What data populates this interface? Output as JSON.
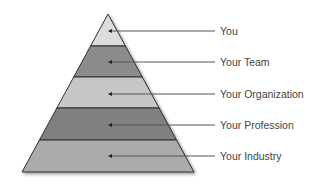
{
  "diagram": {
    "type": "pyramid",
    "apex": [
      108,
      14
    ],
    "base_left": [
      22,
      172
    ],
    "base_right": [
      194,
      172
    ],
    "outline_color": "#2e2e2e",
    "arrow_color": "#555555",
    "label_color": "#444444",
    "levels": [
      {
        "label": "You",
        "top": 14,
        "bottom": 46,
        "fill": "#dcdcdc",
        "arrow_y": 31
      },
      {
        "label": "Your Team",
        "top": 46,
        "bottom": 77,
        "fill": "#8c8c8c",
        "arrow_y": 62
      },
      {
        "label": "Your Organization",
        "top": 77,
        "bottom": 108,
        "fill": "#c6c6c6",
        "arrow_y": 94
      },
      {
        "label": "Your Profession",
        "top": 108,
        "bottom": 140,
        "fill": "#808080",
        "arrow_y": 125
      },
      {
        "label": "Your Industry",
        "top": 140,
        "bottom": 172,
        "fill": "#ababab",
        "arrow_y": 156
      }
    ],
    "arrow_start_x": 109,
    "arrow_end_x": 215
  }
}
